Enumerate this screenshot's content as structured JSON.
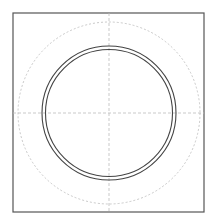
{
  "diagram": {
    "width": 214,
    "height": 219,
    "background": "#ffffff",
    "frame": {
      "x": 13,
      "y": 13,
      "width": 191,
      "height": 199,
      "stroke": "#555555",
      "stroke_width": 1.2
    },
    "center": {
      "x": 109,
      "y": 113
    },
    "centerlines": {
      "stroke": "#bbbbbb",
      "dash": "3 2",
      "stroke_width": 0.8
    },
    "dashed_circle": {
      "r": 91,
      "stroke": "#bbbbbb",
      "dash": "2 2",
      "stroke_width": 0.8
    },
    "ring": {
      "outer_r": 67,
      "inner_r": 63.5,
      "stroke": "#444444",
      "stroke_width": 1.1
    }
  }
}
